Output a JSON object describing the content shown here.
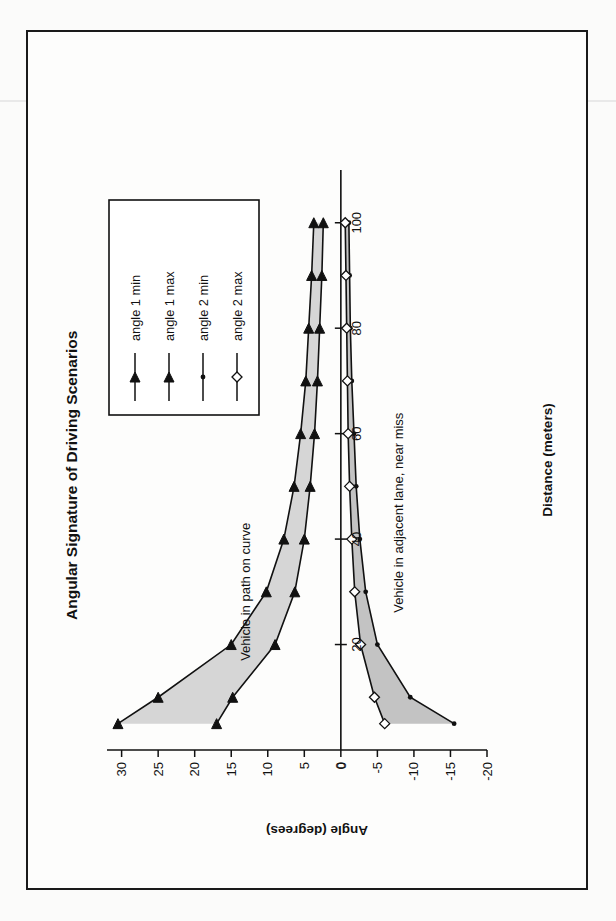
{
  "document": {
    "background_color": "#fbfbfa",
    "frame_color": "#1a1a1a"
  },
  "chart_data": {
    "type": "line",
    "title": "Angular Signature of Driving Scenarios",
    "xlabel": "Distance (meters)",
    "ylabel": "Angle (degrees)",
    "xlim": [
      0,
      110
    ],
    "ylim": [
      -20,
      32
    ],
    "xticks": [
      0,
      20,
      40,
      60,
      80,
      100
    ],
    "yticks": [
      -20,
      -15,
      -10,
      -5,
      0,
      5,
      10,
      15,
      20,
      25,
      30
    ],
    "grid": false,
    "legend_position": "top-right",
    "x": [
      5,
      10,
      20,
      30,
      40,
      50,
      60,
      70,
      80,
      90,
      100
    ],
    "series": [
      {
        "name": "angle 1 min",
        "marker": "triangle-filled",
        "values": [
          17.0,
          14.8,
          9.0,
          6.3,
          5.0,
          4.2,
          3.6,
          3.2,
          2.9,
          2.6,
          2.4
        ]
      },
      {
        "name": "angle 1 max",
        "marker": "triangle-filled",
        "values": [
          30.5,
          25.0,
          15.0,
          10.2,
          7.8,
          6.4,
          5.5,
          4.8,
          4.4,
          4.0,
          3.7
        ]
      },
      {
        "name": "angle 2 min",
        "marker": "dot-small",
        "values": [
          -15.5,
          -9.5,
          -5.0,
          -3.4,
          -2.6,
          -2.1,
          -1.8,
          -1.5,
          -1.3,
          -1.2,
          -1.1
        ]
      },
      {
        "name": "angle 2 max",
        "marker": "diamond-open",
        "values": [
          -6.0,
          -4.6,
          -2.7,
          -1.9,
          -1.5,
          -1.2,
          -1.0,
          -0.9,
          -0.8,
          -0.7,
          -0.6
        ]
      }
    ],
    "band_fills": [
      {
        "between": [
          "angle 1 min",
          "angle 1 max"
        ],
        "color": "#cfcfcf"
      },
      {
        "between": [
          "angle 2 min",
          "angle 2 max"
        ],
        "color": "#b9b9b9"
      }
    ],
    "annotations": [
      {
        "text": "Vehicle in path on curve",
        "x": 30,
        "y": 12.5
      },
      {
        "text": "Vehicle in adjacent lane, near miss",
        "x": 45,
        "y": -8.5
      }
    ]
  },
  "legend": {
    "items": [
      {
        "label": "angle 1 min",
        "marker": "triangle-filled"
      },
      {
        "label": "angle 1 max",
        "marker": "triangle-filled"
      },
      {
        "label": "angle 2 min",
        "marker": "dot-small"
      },
      {
        "label": "angle 2 max",
        "marker": "diamond-open"
      }
    ]
  },
  "axis_tick_labels": {
    "x": [
      "0",
      "20",
      "40",
      "60",
      "80",
      "100"
    ],
    "y": [
      "30",
      "25",
      "20",
      "15",
      "10",
      "5",
      "0",
      "-5",
      "-10",
      "-15",
      "-20"
    ]
  }
}
